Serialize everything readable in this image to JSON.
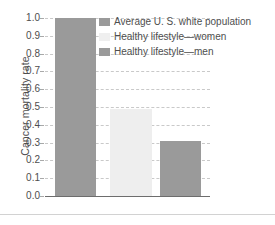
{
  "chart_data": {
    "type": "bar",
    "title": "",
    "subtitle": "",
    "xlabel": "",
    "ylabel": "Cancer mortality rate",
    "ylim": [
      0.0,
      1.0
    ],
    "grid": true,
    "grid_style": "dashed horizontal",
    "legend_position": "top-right inside plot",
    "categories": [
      "Average U. S. white population",
      "Healthy lifestyle—women",
      "Healthy lifestyle—men"
    ],
    "values": [
      1.0,
      0.49,
      0.31
    ],
    "ytick_labels": [
      "0.0",
      "0.1",
      "0.2",
      "0.3",
      "0.4",
      "0.5",
      "0.6",
      "0.7",
      "0.8",
      "0.9",
      "1.0"
    ],
    "ytick_values": [
      0.0,
      0.1,
      0.2,
      0.3,
      0.4,
      0.5,
      0.6,
      0.7,
      0.8,
      0.9,
      1.0
    ],
    "xtick_labels": [],
    "series": [
      {
        "name": "Average U. S. white population",
        "value": 1.0,
        "color": "#9a9a9a"
      },
      {
        "name": "Healthy lifestyle—women",
        "value": 0.49,
        "color": "#eeeeee"
      },
      {
        "name": "Healthy lifestyle—men",
        "value": 0.31,
        "color": "#9a9a9a"
      }
    ],
    "annotations": []
  },
  "legend": {
    "items": [
      {
        "label": "Average U. S. white population",
        "color": "#9a9a9a"
      },
      {
        "label": "Healthy lifestyle—women",
        "color": "#efefef"
      },
      {
        "label": "Healthy lifestyle—men",
        "color": "#9a9a9a"
      }
    ]
  },
  "axis": {
    "y_title": "Cancer mortality rate",
    "ticks": [
      "1.0",
      "0.9",
      "0.8",
      "0.7",
      "0.6",
      "0.5",
      "0.4",
      "0.3",
      "0.2",
      "0.1",
      "0.0"
    ]
  },
  "colors": {
    "bar_dark": "#9a9a9a",
    "bar_light": "#eeeeee",
    "gridline": "#c9c9c9",
    "axis_line": "#6d6d6d",
    "text": "#4e4e4e",
    "background": "#ffffff",
    "page_rule": "#d2d2d2"
  }
}
